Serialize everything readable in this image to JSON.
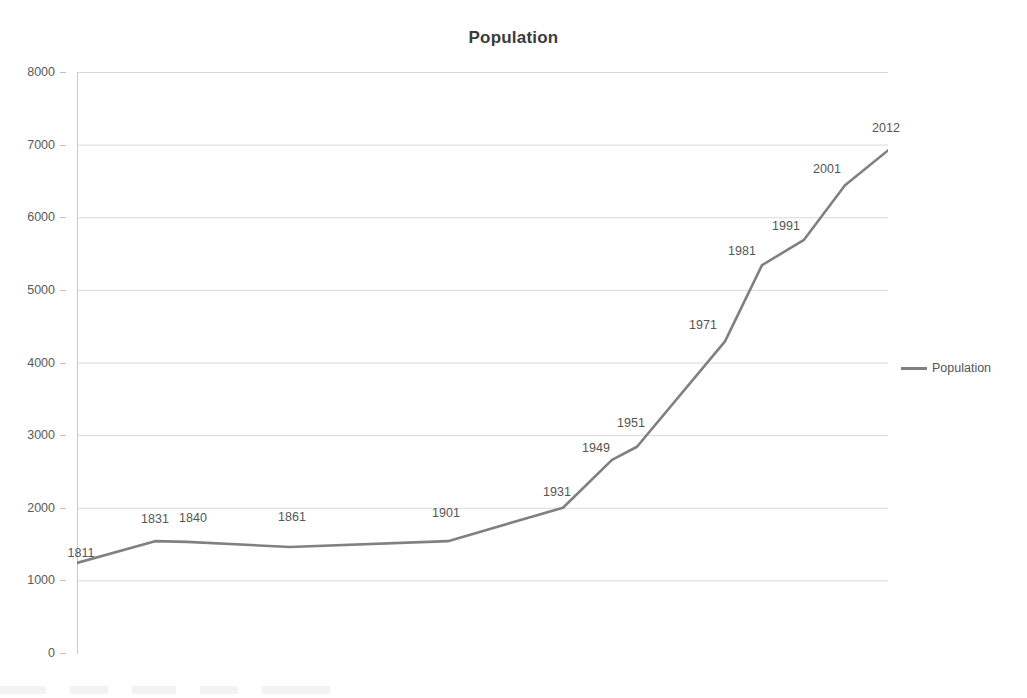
{
  "chart_data": {
    "type": "line",
    "title": "Population",
    "xlabel": "",
    "ylabel": "",
    "ylim": [
      0,
      8000
    ],
    "ytick_labels": [
      "8000",
      "7000",
      "6000",
      "5000",
      "4000",
      "3000",
      "2000",
      "1000",
      "0"
    ],
    "ytick_values": [
      8000,
      7000,
      6000,
      5000,
      4000,
      3000,
      2000,
      1000,
      0
    ],
    "grid": true,
    "legend_position": "right",
    "legend_entries": [
      "Population"
    ],
    "x_axis_tick_labels": [],
    "categories": [
      "1811",
      "1831",
      "1840",
      "1861",
      "1901",
      "1931",
      "1949",
      "1951",
      "1971",
      "1981",
      "1991",
      "2001",
      "2012"
    ],
    "point_labels": [
      "1811",
      "1831",
      "1840",
      "1861",
      "1901",
      "1931",
      "1949",
      "1951",
      "1971",
      "1981",
      "1991",
      "2001",
      "2012"
    ],
    "series": [
      {
        "name": "Population",
        "color": "#808080",
        "values": [
          1240,
          1540,
          1530,
          1460,
          1540,
          2000,
          2660,
          2840,
          4290,
          5340,
          5690,
          6440,
          6920
        ]
      }
    ]
  },
  "legend": {
    "label": "Population",
    "swatch_name": "line-swatch"
  },
  "colors": {
    "series_line": "#808080",
    "gridline": "#d9d9d9",
    "axis": "#c8c8c8",
    "title_text": "#3b3b3b",
    "tick_text": "#5a5a5a",
    "background": "#ffffff"
  }
}
